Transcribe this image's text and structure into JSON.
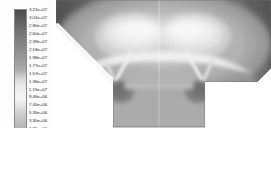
{
  "figure": {
    "title": "",
    "background_color": "#ffffff",
    "plot_region": {
      "x": 55,
      "y": 0,
      "width": 216,
      "height": 128
    }
  },
  "legend": {
    "name": "contour-colorbar",
    "orientation": "vertical",
    "colormap": "grayscale",
    "colormap_stops": [
      {
        "pos": 0.0,
        "color": "#4a4a4a"
      },
      {
        "pos": 0.12,
        "color": "#6e6e6e"
      },
      {
        "pos": 0.26,
        "color": "#8e8e8e"
      },
      {
        "pos": 0.38,
        "color": "#ababab"
      },
      {
        "pos": 0.48,
        "color": "#e9e9e9"
      },
      {
        "pos": 0.56,
        "color": "#f4f4f4"
      },
      {
        "pos": 0.66,
        "color": "#cfcfcf"
      },
      {
        "pos": 0.76,
        "color": "#b2b2b2"
      },
      {
        "pos": 0.86,
        "color": "#8d8d8d"
      },
      {
        "pos": 0.94,
        "color": "#696969"
      },
      {
        "pos": 1.0,
        "color": "#4d4d4d"
      }
    ],
    "labels": [
      "3.21e+07",
      "3.01e+07",
      "2.80e+07",
      "2.60e+07",
      "2.39e+07",
      "2.18e+07",
      "1.98e+07",
      "1.77e+07",
      "1.57e+07",
      "1.36e+07",
      "1.15e+07",
      "9.46e+06",
      "7.40e+06",
      "5.35e+06",
      "3.30e+06",
      "1.25e+06",
      "-8.11e+05",
      "-2.87e+06",
      "-4.92e+06",
      "-6.98e+06",
      "-9.04e+06"
    ]
  },
  "chart_data": {
    "type": "heatmap",
    "title": "",
    "xlabel": "",
    "ylabel": "",
    "colormap": "grayscale",
    "value_min": -9040000.0,
    "value_max": 32100000.0,
    "value_step": 2050000.0,
    "level_count": 21,
    "levels": [
      32100000,
      30100000,
      28000000,
      26000000,
      23900000,
      21800000,
      19800000,
      17700000,
      15700000,
      13600000,
      11500000,
      9460000,
      7400000,
      5350000,
      3300000,
      1250000,
      -811000,
      -2870000,
      -4920000,
      -6980000,
      -9040000
    ],
    "tick_labels": [
      "3.21e+07",
      "3.01e+07",
      "2.80e+07",
      "2.60e+07",
      "2.39e+07",
      "2.18e+07",
      "1.98e+07",
      "1.77e+07",
      "1.57e+07",
      "1.36e+07",
      "1.15e+07",
      "9.46e+06",
      "7.40e+06",
      "5.35e+06",
      "3.30e+06",
      "1.25e+06",
      "-8.11e+05",
      "-2.87e+06",
      "-4.92e+06",
      "-6.98e+06",
      "-9.04e+06"
    ],
    "grid": false,
    "legend_position": "left",
    "regions": [
      {
        "name": "upper-left-corner",
        "relative_value": -0.85
      },
      {
        "name": "upper-right-corner",
        "relative_value": -0.85
      },
      {
        "name": "upper-centre-lobe",
        "relative_value": 0.95
      },
      {
        "name": "central-band",
        "relative_value": 0.55
      },
      {
        "name": "lower-block",
        "relative_value": 0.15
      },
      {
        "name": "block-shoulder-notch",
        "relative_value": -0.35
      }
    ]
  }
}
